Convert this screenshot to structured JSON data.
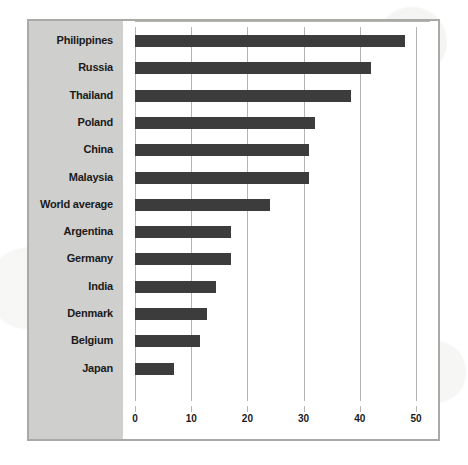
{
  "chart_data": {
    "type": "bar",
    "orientation": "horizontal",
    "title": "",
    "subtitle": "",
    "xlabel": "",
    "ylabel": "",
    "xlim": [
      0,
      50
    ],
    "xticks": [
      0,
      10,
      20,
      30,
      40,
      50
    ],
    "xtick_labels": [
      "0",
      "10",
      "20",
      "30",
      "40",
      "50"
    ],
    "grid": "vertical",
    "legend": "none",
    "categories": [
      "Philippines",
      "Russia",
      "Thailand",
      "Poland",
      "China",
      "Malaysia",
      "World average",
      "Argentina",
      "Germany",
      "India",
      "Denmark",
      "Belgium",
      "Japan"
    ],
    "values": [
      48,
      42,
      38.5,
      32,
      31,
      31,
      24,
      17,
      17,
      14.5,
      12.8,
      11.6,
      6.9
    ],
    "series": [
      {
        "name": "value",
        "values": [
          48,
          42,
          38.5,
          32,
          31,
          31,
          24,
          17,
          17,
          14.5,
          12.8,
          11.6,
          6.9
        ]
      }
    ],
    "bar_color": "#3c3c3c",
    "label_panel_color": "#cfcfcd",
    "gridline_color": "#b4b4b2",
    "frame_color": "#a9a9a6",
    "plot_background": "#ffffff",
    "text_color": "#1a1a1a"
  }
}
